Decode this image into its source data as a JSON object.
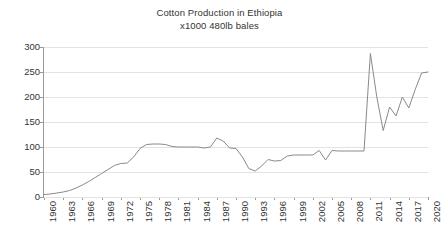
{
  "chart_data": {
    "type": "line",
    "title": "Cotton Production in Ethiopia",
    "subtitle": "x1000 480lb bales",
    "xlabel": "",
    "ylabel": "",
    "ylim": [
      0,
      300
    ],
    "xlim": [
      1960,
      2020
    ],
    "ytick_step": 50,
    "xtick_step": 3,
    "grid": "horizontal",
    "legend": "none",
    "line_color": "#8a8a8a",
    "gridline_color": "#e3e3e3",
    "axis_color": "#9a9a9a",
    "text_color": "#333333",
    "background_color": "#ffffff",
    "ytick_labels": [
      "300",
      "250",
      "200",
      "150",
      "100",
      "50",
      "0"
    ],
    "ytick_values": [
      300,
      250,
      200,
      150,
      100,
      50,
      0
    ],
    "xtick_labels": [
      "1960",
      "1963",
      "1966",
      "1969",
      "1972",
      "1975",
      "1978",
      "1981",
      "1984",
      "1987",
      "1990",
      "1993",
      "1996",
      "1999",
      "2002",
      "2005",
      "2008",
      "2011",
      "2014",
      "2017",
      "2020"
    ],
    "xtick_values": [
      1960,
      1963,
      1966,
      1969,
      1972,
      1975,
      1978,
      1981,
      1984,
      1987,
      1990,
      1993,
      1996,
      1999,
      2002,
      2005,
      2008,
      2011,
      2014,
      2017,
      2020
    ],
    "x": [
      1960,
      1961,
      1962,
      1963,
      1964,
      1965,
      1966,
      1967,
      1968,
      1969,
      1970,
      1971,
      1972,
      1973,
      1974,
      1975,
      1976,
      1977,
      1978,
      1979,
      1980,
      1981,
      1982,
      1983,
      1984,
      1985,
      1986,
      1987,
      1988,
      1989,
      1990,
      1991,
      1992,
      1993,
      1994,
      1995,
      1996,
      1997,
      1998,
      1999,
      2000,
      2001,
      2002,
      2003,
      2004,
      2005,
      2006,
      2007,
      2008,
      2009,
      2010,
      2011,
      2012,
      2013,
      2014,
      2015,
      2016,
      2017,
      2018,
      2019,
      2020
    ],
    "values": [
      5,
      6,
      8,
      10,
      13,
      18,
      24,
      31,
      39,
      47,
      55,
      63,
      67,
      68,
      80,
      97,
      105,
      106,
      106,
      105,
      101,
      100,
      100,
      100,
      100,
      98,
      100,
      118,
      112,
      98,
      97,
      80,
      57,
      52,
      62,
      75,
      72,
      73,
      82,
      84,
      84,
      84,
      84,
      93,
      74,
      93,
      92,
      92,
      92,
      92,
      92,
      287,
      200,
      133,
      180,
      162,
      200,
      178,
      215,
      248,
      250
    ],
    "series": [
      {
        "name": "Cotton Production",
        "values": [
          5,
          6,
          8,
          10,
          13,
          18,
          24,
          31,
          39,
          47,
          55,
          63,
          67,
          68,
          80,
          97,
          105,
          106,
          106,
          105,
          101,
          100,
          100,
          100,
          100,
          98,
          100,
          118,
          112,
          98,
          97,
          80,
          57,
          52,
          62,
          75,
          72,
          73,
          82,
          84,
          84,
          84,
          84,
          93,
          74,
          93,
          92,
          92,
          92,
          92,
          92,
          287,
          200,
          133,
          180,
          162,
          200,
          178,
          215,
          248,
          250
        ]
      }
    ],
    "annotations": [
      {
        "label": "peak",
        "x": 2011,
        "y": 287
      },
      {
        "label": "trough",
        "x": 1993,
        "y": 52
      }
    ]
  }
}
